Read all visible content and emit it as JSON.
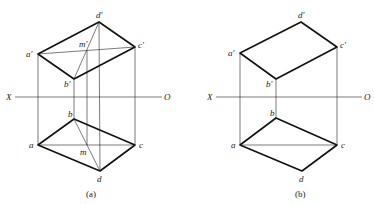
{
  "figures": [
    {
      "id": "a",
      "caption": "(a)",
      "axis": {
        "left_label": "X",
        "right_label": "O"
      },
      "front_view": {
        "labels": {
          "a": "a′",
          "b": "b′",
          "c": "c′",
          "d": "d′",
          "m": "m′"
        }
      },
      "top_view": {
        "labels": {
          "a": "a",
          "b": "b",
          "c": "c",
          "d": "d",
          "m": "m"
        }
      }
    },
    {
      "id": "b",
      "caption": "(b)",
      "axis": {
        "left_label": "X",
        "right_label": "O"
      },
      "front_view": {
        "labels": {
          "a": "a′",
          "b": "b′",
          "c": "c′",
          "d": "d′"
        }
      },
      "top_view": {
        "labels": {
          "a": "a",
          "b": "b",
          "c": "c",
          "d": "d"
        }
      }
    }
  ]
}
